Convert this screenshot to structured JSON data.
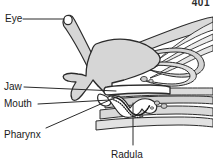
{
  "figure": {
    "page_number": "401",
    "background_color": "#ffffff",
    "ink_color": "#1a1a1a",
    "tissue_fill": "#d9d9d9",
    "tissue_fill_light": "#ececec",
    "tissue_fill_dark": "#c4c4c4",
    "outline_color": "#2b2b2b",
    "leader_color": "#2b2b2b"
  },
  "labels": [
    {
      "id": "eye",
      "text": "Eye",
      "icon": "leader-line-icon",
      "leader": {
        "x1": 23,
        "y1": 19,
        "x2": 64,
        "y2": 19
      }
    },
    {
      "id": "jaw",
      "text": "Jaw",
      "icon": "leader-line-icon",
      "leader": {
        "x1": 24,
        "y1": 87,
        "x2": 116,
        "y2": 91
      }
    },
    {
      "id": "mouth",
      "text": "Mouth",
      "icon": "leader-line-icon",
      "leader": {
        "x1": 38,
        "y1": 104,
        "x2": 110,
        "y2": 100
      }
    },
    {
      "id": "pharynx",
      "text": "Pharynx",
      "icon": "leader-line-icon",
      "leader": {
        "x1": 46,
        "y1": 128,
        "x2": 119,
        "y2": 96
      }
    },
    {
      "id": "radula",
      "text": "Radula",
      "icon": "leader-line-icon",
      "leader": {
        "x1": 133,
        "y1": 145,
        "x2": 133,
        "y2": 103
      }
    }
  ],
  "structures": [
    {
      "name": "eye-stalk",
      "description": "tentacle bearing eye at tip"
    },
    {
      "name": "head-mass",
      "description": "large shaded head / foot mass"
    },
    {
      "name": "jaw",
      "description": "horizontal chitinous jaw plate"
    },
    {
      "name": "mouth",
      "description": "anterior opening below jaw"
    },
    {
      "name": "pharynx",
      "description": "muscular bulb behind mouth"
    },
    {
      "name": "radula",
      "description": "toothed ribbon, serrated outline"
    },
    {
      "name": "tissue-bands",
      "description": "layered body wall and muscle bands extending posteriorly"
    }
  ]
}
